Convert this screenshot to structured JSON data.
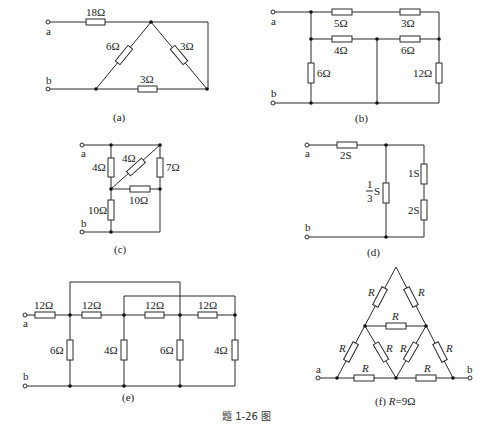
{
  "figure": {
    "caption": "题 1-26 图",
    "terminal_a": "a",
    "terminal_b": "b"
  },
  "circuits": {
    "a": {
      "label": "(a)",
      "resistors": [
        "18Ω",
        "6Ω",
        "3Ω",
        "3Ω"
      ]
    },
    "b": {
      "label": "(b)",
      "resistors": [
        "5Ω",
        "3Ω",
        "4Ω",
        "6Ω",
        "6Ω",
        "12Ω"
      ]
    },
    "c": {
      "label": "(c)",
      "resistors": [
        "4Ω",
        "4Ω",
        "7Ω",
        "10Ω",
        "10Ω"
      ]
    },
    "d": {
      "label": "(d)",
      "conductances": [
        "2S",
        "1S",
        "2S"
      ],
      "fraction": {
        "num": "1",
        "den": "3",
        "unit": "S"
      }
    },
    "e": {
      "label": "(e)",
      "series": [
        "12Ω",
        "12Ω",
        "12Ω",
        "12Ω"
      ],
      "shunts": [
        "6Ω",
        "4Ω",
        "6Ω",
        "4Ω"
      ]
    },
    "f": {
      "label_prefix": "(f) ",
      "label_var": "R",
      "label_value": "=9Ω",
      "resistor_symbol": "R"
    }
  }
}
